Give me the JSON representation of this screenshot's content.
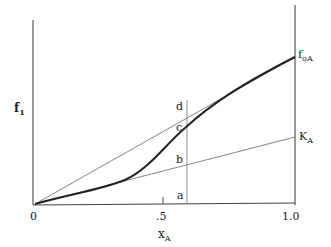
{
  "diagram": {
    "y_axis_label": "f",
    "y_axis_label_sub": "1",
    "x_axis_label": "x",
    "x_axis_label_sub": "A",
    "x_ticks": [
      {
        "value": 0,
        "label": "0"
      },
      {
        "value": 0.5,
        "label": ".5"
      },
      {
        "value": 1.0,
        "label": "1.0"
      }
    ],
    "right_labels": {
      "top": "f",
      "top_sub": "oA",
      "mid": "K",
      "mid_sub": "A"
    },
    "points": {
      "a": "a",
      "b": "b",
      "c": "c",
      "d": "d"
    },
    "lines": [
      {
        "name": "chord-origin-to-f0A",
        "from": [
          0,
          0
        ],
        "to": [
          1.0,
          "f0A"
        ]
      },
      {
        "name": "tangent-henry-KA",
        "from": [
          0,
          0
        ],
        "to": [
          1.0,
          "KA"
        ]
      },
      {
        "name": "fugacity-curve",
        "type": "curve"
      },
      {
        "name": "vertical-at-xA",
        "x": 0.6
      }
    ]
  }
}
